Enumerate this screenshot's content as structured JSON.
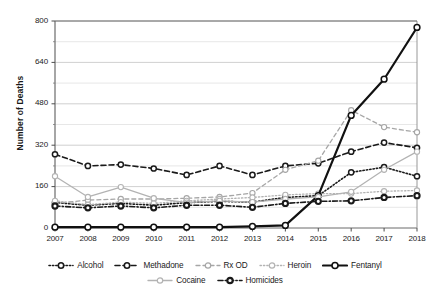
{
  "chart_data": {
    "type": "line",
    "title": "",
    "xlabel": "",
    "ylabel": "Number of Deaths",
    "categories": [
      2007,
      2008,
      2009,
      2010,
      2011,
      2012,
      2013,
      2014,
      2015,
      2016,
      2017,
      2018
    ],
    "xtick_labels": [
      "2007",
      "2008",
      "2009",
      "2010",
      "2011",
      "2012",
      "2013",
      "2014",
      "2015",
      "2016",
      "2017",
      "2018"
    ],
    "ytick_labels": [
      "0",
      "160",
      "320",
      "480",
      "640",
      "800"
    ],
    "ytick_values": [
      0,
      160,
      320,
      480,
      640,
      800
    ],
    "ylim": [
      0,
      800
    ],
    "minor_gridlines": [
      80,
      240,
      400,
      560,
      720
    ],
    "grid": true,
    "legend_position": "bottom",
    "series": [
      {
        "name": "Alcohol",
        "color": "#1a1a1a",
        "style": "dotted",
        "width": 1.6,
        "marker": "open-circle",
        "values": [
          98,
          88,
          95,
          88,
          98,
          103,
          100,
          118,
          125,
          215,
          235,
          200
        ]
      },
      {
        "name": "Methadone",
        "color": "#1a1a1a",
        "style": "dashed",
        "width": 1.6,
        "marker": "open-circle",
        "values": [
          285,
          240,
          245,
          230,
          205,
          240,
          205,
          240,
          250,
          295,
          330,
          310
        ]
      },
      {
        "name": "Rx OD",
        "color": "#a6a6a6",
        "style": "dashed",
        "width": 1.3,
        "marker": "open-circle",
        "values": [
          95,
          108,
          112,
          112,
          115,
          120,
          135,
          225,
          260,
          455,
          390,
          370
        ]
      },
      {
        "name": "Heroin",
        "color": "#b3b3b3",
        "style": "dotted",
        "width": 1.3,
        "marker": "open-circle",
        "values": [
          105,
          90,
          100,
          95,
          105,
          112,
          118,
          128,
          133,
          133,
          142,
          145
        ]
      },
      {
        "name": "Fentanyl",
        "color": "#111111",
        "style": "solid",
        "width": 2.2,
        "marker": "open-circle",
        "values": [
          3,
          3,
          3,
          3,
          3,
          3,
          6,
          10,
          125,
          435,
          575,
          775
        ]
      },
      {
        "name": "Cocaine",
        "color": "#b3b3b3",
        "style": "solid",
        "width": 1.3,
        "marker": "open-circle",
        "values": [
          200,
          120,
          158,
          115,
          98,
          105,
          100,
          112,
          120,
          140,
          225,
          295
        ]
      },
      {
        "name": "Homicides",
        "color": "#1a1a1a",
        "style": "dashdot",
        "width": 1.6,
        "marker": "filled-circle",
        "values": [
          85,
          78,
          85,
          78,
          88,
          88,
          80,
          95,
          103,
          105,
          118,
          125
        ]
      }
    ]
  },
  "legend": {
    "rows": [
      [
        "Alcohol",
        "Methadone",
        "Rx OD",
        "Heroin",
        "Fentanyl"
      ],
      [
        "Cocaine",
        "Homicides"
      ]
    ]
  }
}
